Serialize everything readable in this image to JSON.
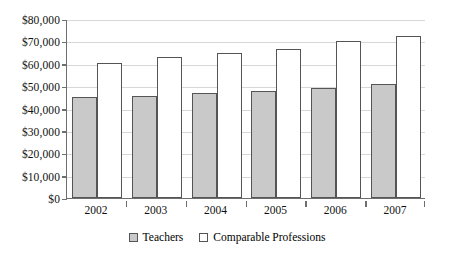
{
  "chart_data": {
    "type": "bar",
    "title": "",
    "xlabel": "",
    "ylabel": "",
    "ylim": [
      0,
      80000
    ],
    "grid": true,
    "legend_position": "bottom-center",
    "categories": [
      "2002",
      "2003",
      "2004",
      "2005",
      "2006",
      "2007"
    ],
    "y_tick_labels": [
      "$80,000",
      "$70,000",
      "$60,000",
      "$50,000",
      "$40,000",
      "$30,000",
      "$20,000",
      "$10,000",
      "$0"
    ],
    "y_tick_values": [
      80000,
      70000,
      60000,
      50000,
      40000,
      30000,
      20000,
      10000,
      0
    ],
    "series": [
      {
        "name": "Teachers",
        "color": "#c9c9c9",
        "values": [
          45000,
          45500,
          46800,
          47800,
          49200,
          51000
        ]
      },
      {
        "name": "Comparable Professions",
        "color": "#ffffff",
        "values": [
          60500,
          63000,
          65000,
          66500,
          70000,
          72500
        ]
      }
    ]
  }
}
